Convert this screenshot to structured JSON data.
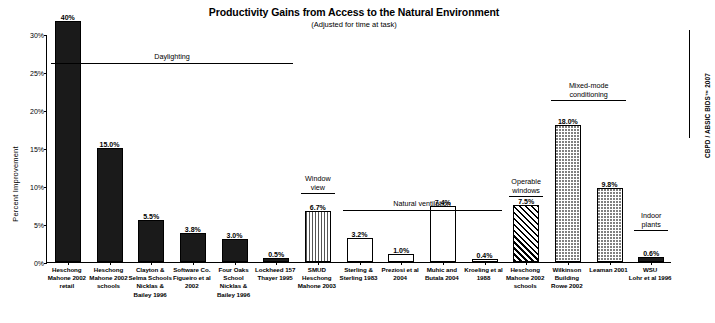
{
  "chart_data": {
    "type": "bar",
    "title": "Productivity Gains from Access to the Natural Environment",
    "subtitle": "(Adjusted for time at task)",
    "xlabel": "",
    "ylabel": "Percent Improvement",
    "ylim": [
      0,
      30
    ],
    "ytick_labels": [
      "0%",
      "5%",
      "10%",
      "15%",
      "20%",
      "25%",
      "30%"
    ],
    "ytick_values": [
      0,
      5,
      10,
      15,
      20,
      25,
      30
    ],
    "grid": false,
    "legend": "none",
    "value_unit": "%",
    "categories": [
      "Heschong Mahone 2002 retail",
      "Heschong Mahone 2002 schools",
      "Clayton & Selma Schools Nicklas & Bailey 1996",
      "Software Co. Figueiro et al 2002",
      "Four Oaks School Nicklas & Bailey 1996",
      "Lockheed 157 Thayer 1995",
      "SMUD Heschong Mahone 2003",
      "Sterling & Sterling 1983",
      "Preziosi et al 2004",
      "Muhic and Butala 2004",
      "Kroeling et al 1988",
      "Heschong Mahone 2002 schools",
      "Wilkinson Building Rowe 2002",
      "Leaman 2001",
      "WSU Lohr et al 1996"
    ],
    "values": [
      40.0,
      15.0,
      5.5,
      3.8,
      3.0,
      0.5,
      6.7,
      3.2,
      1.0,
      7.4,
      0.4,
      7.5,
      18.0,
      9.8,
      0.6
    ],
    "value_labels": [
      "40%",
      "15.0%",
      "5.5%",
      "3.8%",
      "3.0%",
      "0.5%",
      "6.7%",
      "3.2%",
      "1.0%",
      "7.4%",
      "0.4%",
      "7.5%",
      "18.0%",
      "9.8%",
      "0.6%"
    ],
    "annotations": [
      {
        "label": "Daylighting",
        "span": [
          0,
          5
        ]
      },
      {
        "label": "Window\nview",
        "span": [
          6,
          6
        ]
      },
      {
        "label": "Natural ventilation",
        "span": [
          7,
          10
        ]
      },
      {
        "label": "Operable\nwindows",
        "span": [
          11,
          11
        ]
      },
      {
        "label": "Mixed-mode\nconditioning",
        "span": [
          12,
          13
        ]
      },
      {
        "label": "Indoor\nplants",
        "span": [
          14,
          14
        ]
      }
    ],
    "source_note": "CBPD / ABSIC BIDS™ 2007"
  },
  "bars": [
    {
      "name": "heschong-mahone-2002-retail",
      "label_lines": [
        "Heschong",
        "Mahone 2002",
        "retail"
      ],
      "value_label": "40%",
      "value": 40.0,
      "fill": "solid"
    },
    {
      "name": "heschong-mahone-2002-schools",
      "label_lines": [
        "Heschong",
        "Mahone 2002",
        "schools"
      ],
      "value_label": "15.0%",
      "value": 15.0,
      "fill": "solid"
    },
    {
      "name": "clayton-selma-schools",
      "label_lines": [
        "Clayton &",
        "Selma Schools",
        "Nicklas &",
        "Bailey 1996"
      ],
      "value_label": "5.5%",
      "value": 5.5,
      "fill": "solid"
    },
    {
      "name": "software-co-figueiro",
      "label_lines": [
        "Software Co.",
        "Figueiro et al",
        "2002"
      ],
      "value_label": "3.8%",
      "value": 3.8,
      "fill": "solid"
    },
    {
      "name": "four-oaks-school",
      "label_lines": [
        "Four Oaks",
        "School",
        "Nicklas &",
        "Bailey 1996"
      ],
      "value_label": "3.0%",
      "value": 3.0,
      "fill": "solid"
    },
    {
      "name": "lockheed-157-thayer",
      "label_lines": [
        "Lockheed 157",
        "Thayer 1995"
      ],
      "value_label": "0.5%",
      "value": 0.5,
      "fill": "solid"
    },
    {
      "name": "smud-heschong-mahone-2003",
      "label_lines": [
        "SMUD",
        "Heschong",
        "Mahone 2003"
      ],
      "value_label": "6.7%",
      "value": 6.7,
      "fill": "vstripe"
    },
    {
      "name": "sterling-sterling-1983",
      "label_lines": [
        "Sterling &",
        "Sterling 1983"
      ],
      "value_label": "3.2%",
      "value": 3.2,
      "fill": "hollow"
    },
    {
      "name": "preziosi-et-al-2004",
      "label_lines": [
        "Preziosi et al",
        "2004"
      ],
      "value_label": "1.0%",
      "value": 1.0,
      "fill": "hollow"
    },
    {
      "name": "muhic-and-butala-2004",
      "label_lines": [
        "Muhic and",
        "Butala 2004"
      ],
      "value_label": "7.4%",
      "value": 7.4,
      "fill": "hollow"
    },
    {
      "name": "kroeling-et-al-1988",
      "label_lines": [
        "Kroeling et al",
        "1988"
      ],
      "value_label": "0.4%",
      "value": 0.4,
      "fill": "hollow"
    },
    {
      "name": "heschong-mahone-2002-schools-ow",
      "label_lines": [
        "Heschong",
        "Mahone 2002",
        "schools"
      ],
      "value_label": "7.5%",
      "value": 7.5,
      "fill": "diag"
    },
    {
      "name": "wilkinson-building-rowe-2002",
      "label_lines": [
        "Wilkinson",
        "Building",
        "Rowe 2002"
      ],
      "value_label": "18.0%",
      "value": 18.0,
      "fill": "dots"
    },
    {
      "name": "leaman-2001",
      "label_lines": [
        "Leaman 2001"
      ],
      "value_label": "9.8%",
      "value": 9.8,
      "fill": "dots"
    },
    {
      "name": "wsu-lohr-et-al-1996",
      "label_lines": [
        "WSU",
        "Lohr et al 1996"
      ],
      "value_label": "0.6%",
      "value": 0.6,
      "fill": "solid"
    }
  ],
  "annotations": [
    {
      "name": "daylighting",
      "text": "Daylighting"
    },
    {
      "name": "window-view",
      "text": "Window\nview"
    },
    {
      "name": "natural-ventilation",
      "text": "Natural ventilation"
    },
    {
      "name": "operable-windows",
      "text": "Operable\nwindows"
    },
    {
      "name": "mixed-mode",
      "text": "Mixed-mode\nconditioning"
    },
    {
      "name": "indoor-plants",
      "text": "Indoor\nplants"
    }
  ],
  "axis": {
    "y_label": "Percent Improvement",
    "y_ticks": [
      "30%",
      "25%",
      "20%",
      "15%",
      "10%",
      "5%",
      "0%"
    ]
  },
  "title": "Productivity Gains from Access to the Natural Environment",
  "subtitle": "(Adjusted for time at task)",
  "source_note": "CBPD / ABSIC BIDS™ 2007"
}
